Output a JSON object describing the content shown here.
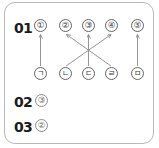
{
  "sheet": {
    "title": "matching-answer-sheet",
    "border_color": "#b9b9b9",
    "line_color": "#8a8a8a"
  },
  "questions": [
    {
      "number": "01",
      "type": "matching",
      "top_options": [
        {
          "id": "opt1",
          "label": "①"
        },
        {
          "id": "opt2",
          "label": "②"
        },
        {
          "id": "opt3",
          "label": "③"
        },
        {
          "id": "opt4",
          "label": "④"
        },
        {
          "id": "opt5",
          "label": "⑤"
        }
      ],
      "bottom_options": [
        {
          "id": "kr1",
          "label": "ㄱ"
        },
        {
          "id": "kr2",
          "label": "ㄴ"
        },
        {
          "id": "kr3",
          "label": "ㄷ"
        },
        {
          "id": "kr4",
          "label": "ㄹ"
        },
        {
          "id": "kr5",
          "label": "ㅁ"
        }
      ],
      "connections": [
        {
          "from": "kr1",
          "to": "opt1",
          "style": "vertical",
          "arrow": "up"
        },
        {
          "from": "kr4",
          "to": "opt2",
          "style": "diagonal",
          "arrow": "up"
        },
        {
          "from": "kr3",
          "to": "opt3",
          "style": "vertical",
          "arrow": "up"
        },
        {
          "from": "kr2",
          "to": "opt4",
          "style": "diagonal",
          "arrow": "up"
        },
        {
          "from": "kr5",
          "to": "opt5",
          "style": "vertical",
          "arrow": "up"
        }
      ]
    },
    {
      "number": "02",
      "type": "multiple-choice",
      "answer": "③"
    },
    {
      "number": "03",
      "type": "multiple-choice",
      "answer": "②"
    }
  ]
}
